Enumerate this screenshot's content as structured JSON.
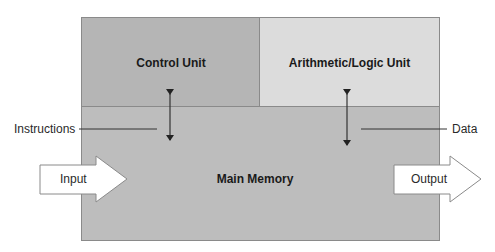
{
  "diagram": {
    "blocks": {
      "control_unit": {
        "label": "Control Unit",
        "fill": "#b5b5b5"
      },
      "alu": {
        "label": "Arithmetic/Logic Unit",
        "fill": "#dcdcdc"
      },
      "main_memory": {
        "label": "Main Memory",
        "fill": "#bdbdbd"
      }
    },
    "arrows": {
      "input": {
        "label": "Input",
        "direction": "right"
      },
      "output": {
        "label": "Output",
        "direction": "right"
      },
      "control_memory": {
        "type": "bidirectional",
        "between": [
          "Control Unit",
          "Main Memory"
        ]
      },
      "alu_memory": {
        "type": "bidirectional",
        "between": [
          "Arithmetic/Logic Unit",
          "Main Memory"
        ]
      }
    },
    "callouts": {
      "instructions": "Instructions",
      "data": "Data"
    },
    "colors": {
      "border": "#8a8a8a",
      "arrow_fill": "#ffffff",
      "arrow_stroke": "#8a8a8a",
      "line": "#333333"
    }
  }
}
